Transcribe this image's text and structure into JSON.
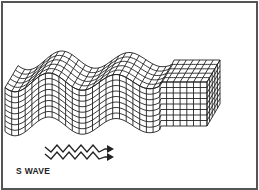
{
  "figure": {
    "label": "S WAVE",
    "icons": [
      "zigzag-arrow-icon"
    ],
    "colors": {
      "line": "#222222",
      "frame": "#555555",
      "background": "#ffffff"
    }
  }
}
